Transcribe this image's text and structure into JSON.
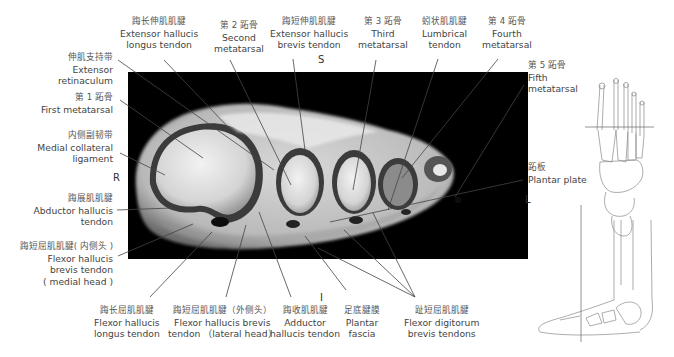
{
  "figure": {
    "type": "MRI axial section of forefoot with anatomical labels",
    "orientation": {
      "superior": "S",
      "inferior": "I",
      "right": "R",
      "left": "L"
    },
    "labels_top": [
      {
        "id": "ehl",
        "zh": "踇长伸肌肌腱",
        "en1": "Extensor hallucis",
        "en2": "longus tendon"
      },
      {
        "id": "mt2",
        "zh": "第 2 跖骨",
        "en1": "Second",
        "en2": "metatarsal"
      },
      {
        "id": "ehb",
        "zh": "踇短伸肌肌腱",
        "en1": "Extensor hallucis",
        "en2": "brevis tendon"
      },
      {
        "id": "mt3",
        "zh": "第 3 跖骨",
        "en1": "Third",
        "en2": "metatarsal"
      },
      {
        "id": "lumb",
        "zh": "蚓状肌肌腱",
        "en1": "Lumbrical",
        "en2": "tendon"
      },
      {
        "id": "mt4",
        "zh": "第 4 跖骨",
        "en1": "Fourth",
        "en2": "metatarsal"
      }
    ],
    "labels_left": [
      {
        "id": "ret",
        "zh": "伸肌支持带",
        "en1": "Extensor",
        "en2": "retinaculum"
      },
      {
        "id": "mt1",
        "zh": "第 1 跖骨",
        "en1": "First metatarsal"
      },
      {
        "id": "mcl",
        "zh": "内侧副韧带",
        "en1": "Medial collateral",
        "en2": "ligament"
      },
      {
        "id": "abd",
        "zh": "踇展肌肌腱",
        "en1": "Abductor hallucis",
        "en2": "tendon"
      },
      {
        "id": "fhbm",
        "zh": "踇短屈肌肌腱( 内侧头 )",
        "en1": "Flexor hallucis",
        "en2": "brevis tendon",
        "en3": "( medial head )"
      }
    ],
    "labels_right": [
      {
        "id": "mt5",
        "zh": "第 5 跖骨",
        "en1": "Fifth",
        "en2": "metatarsal"
      },
      {
        "id": "pp",
        "zh": "跖板",
        "en1": "Plantar plate"
      }
    ],
    "labels_bottom": [
      {
        "id": "fhl",
        "zh": "踇长屈肌肌腱",
        "en1": "Flexor hallucis",
        "en2": "longus tendon"
      },
      {
        "id": "fhbl",
        "zh": "踇短屈肌肌腱（外侧头）",
        "en1": "Flexor hallucis brevis",
        "en2": "tendon （lateral head）"
      },
      {
        "id": "add",
        "zh": "踇收肌肌腱",
        "en1": "Adductor",
        "en2": "hallucis tendon"
      },
      {
        "id": "pf",
        "zh": "足底腱膜",
        "en1": "Plantar",
        "en2": "fascia"
      },
      {
        "id": "fdb",
        "zh": "趾短屈肌肌腱",
        "en1": "Flexor digitorum",
        "en2": "brevis tendons"
      }
    ],
    "reference_images": [
      {
        "name": "dorsal-foot-skeleton",
        "plane": "horizontal line across metatarsals"
      },
      {
        "name": "lateral-foot-skeleton",
        "plane": "vertical line through midfoot"
      }
    ]
  }
}
